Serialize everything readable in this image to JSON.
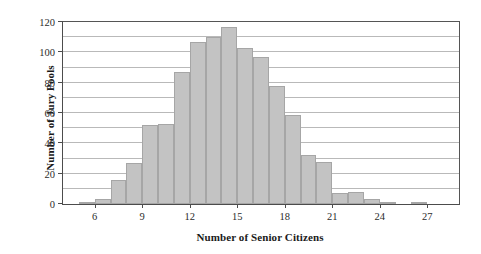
{
  "chart_data": {
    "type": "bar",
    "title": "",
    "xlabel": "Number of Senior Citizens",
    "ylabel": "Number of Jury Pools",
    "xlim": [
      4,
      29
    ],
    "ylim": [
      0,
      120
    ],
    "grid": true,
    "legend": null,
    "xticks": [
      6,
      9,
      12,
      15,
      18,
      21,
      24,
      27
    ],
    "xtick_labels": [
      "6",
      "9",
      "12",
      "15",
      "18",
      "21",
      "24",
      "27"
    ],
    "yticks": [
      0,
      20,
      40,
      60,
      80,
      100,
      120
    ],
    "ytick_labels": [
      "0",
      "20",
      "40",
      "60",
      "80",
      "100",
      "120"
    ],
    "gridlines": [
      10,
      20,
      30,
      40,
      50,
      60,
      70,
      80,
      90,
      100,
      110
    ],
    "bin_width": 1,
    "categories": [
      4,
      5,
      6,
      7,
      8,
      9,
      10,
      11,
      12,
      13,
      14,
      15,
      16,
      17,
      18,
      19,
      20,
      21,
      22,
      23,
      24,
      25,
      26,
      27,
      28
    ],
    "values": [
      0,
      1,
      3,
      16,
      27,
      52,
      53,
      87,
      107,
      110,
      117,
      103,
      97,
      78,
      59,
      32,
      28,
      7,
      8,
      3,
      1,
      0,
      1,
      0,
      0
    ]
  }
}
